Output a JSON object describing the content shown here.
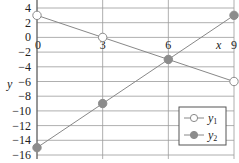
{
  "chart_data": {
    "type": "line",
    "title": "",
    "xlabel": "x",
    "ylabel": "y",
    "xlim": [
      0,
      9
    ],
    "ylim": [
      -16,
      4
    ],
    "grid": true,
    "x_ticks": [
      0,
      3,
      6,
      9
    ],
    "x_tick_labels": [
      "0",
      "3",
      "6",
      "9"
    ],
    "y_ticks": [
      4,
      2,
      0,
      -2,
      -4,
      -6,
      -8,
      -10,
      -12,
      -14,
      -16
    ],
    "y_tick_labels": [
      "4",
      "2",
      "0",
      "−2",
      "−4",
      "−6",
      "−8",
      "−10",
      "−12",
      "−14",
      "−16"
    ],
    "legend_position": "lower right",
    "series": [
      {
        "name": "y1",
        "label_base": "y",
        "label_sub": "1",
        "marker": "open-circle",
        "color": "#888888",
        "x": [
          0,
          3,
          9
        ],
        "values": [
          3,
          0,
          -6
        ]
      },
      {
        "name": "y2",
        "label_base": "y",
        "label_sub": "2",
        "marker": "filled-circle",
        "color": "#888888",
        "x": [
          0,
          3,
          6,
          9
        ],
        "values": [
          -15,
          -9,
          -3,
          3
        ]
      }
    ]
  }
}
